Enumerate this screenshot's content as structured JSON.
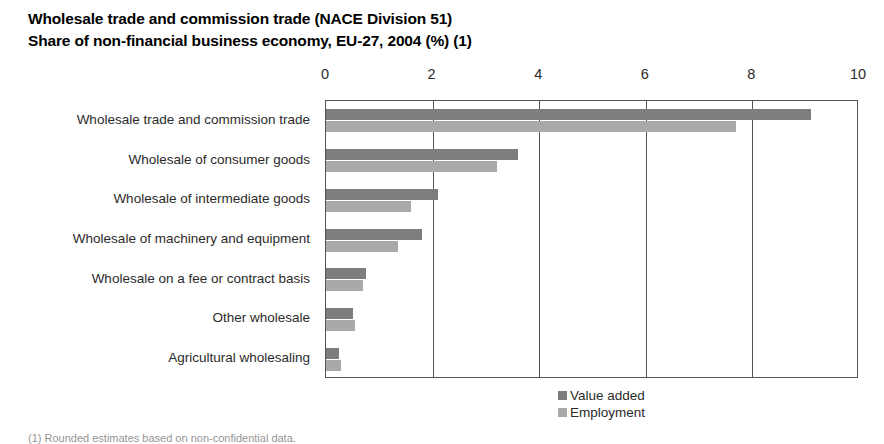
{
  "title": {
    "line1": "Wholesale trade and commission trade (NACE Division 51)",
    "line2": "Share of non-financial business economy, EU-27, 2004 (%) (1)"
  },
  "footnote": "(1) Rounded estimates based on non-confidential data.",
  "legend": {
    "value_added_label": "Value added",
    "employment_label": "Employment"
  },
  "colors": {
    "value_added": "#7d7d7d",
    "employment": "#a9a9a9",
    "axis": "#555555"
  },
  "chart_data": {
    "type": "bar",
    "orientation": "horizontal",
    "xlabel": "",
    "ylabel": "",
    "xlim": [
      0,
      10
    ],
    "xticks": [
      0,
      2,
      4,
      6,
      8,
      10
    ],
    "xtick_labels": [
      "0",
      "2",
      "4",
      "6",
      "8",
      "10"
    ],
    "grid": true,
    "legend_position": "bottom-right",
    "categories": [
      "Wholesale trade and commission trade",
      "Wholesale of consumer goods",
      "Wholesale of intermediate goods",
      "Wholesale of machinery and equipment",
      "Wholesale on a fee or contract basis",
      "Other wholesale",
      "Agricultural wholesaling"
    ],
    "series": [
      {
        "name": "Value added",
        "color": "#7d7d7d",
        "values": [
          9.1,
          3.6,
          2.1,
          1.8,
          0.75,
          0.5,
          0.25
        ]
      },
      {
        "name": "Employment",
        "color": "#a9a9a9",
        "values": [
          7.7,
          3.2,
          1.6,
          1.35,
          0.7,
          0.55,
          0.28
        ]
      }
    ]
  }
}
